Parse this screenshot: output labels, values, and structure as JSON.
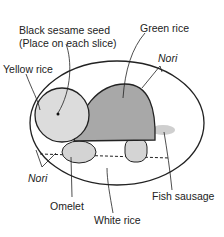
{
  "diagram": {
    "labels": {
      "black_sesame_line1": "Black sesame seed",
      "black_sesame_line2": "(Place on each slice)",
      "green_rice": "Green rice",
      "nori_top": "Nori",
      "yellow_rice": "Yellow rice",
      "nori_left": "Nori",
      "omelet": "Omelet",
      "fish_sausage": "Fish sausage",
      "white_rice": "White rice"
    },
    "colors": {
      "outline": "#222222",
      "shell": "#a8a8a8",
      "head": "#dcdcdc",
      "legs": "#d4d4d4",
      "tail": "#cfcfcf",
      "background": "#ffffff"
    }
  }
}
